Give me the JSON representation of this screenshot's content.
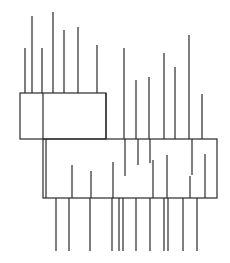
{
  "diagram": {
    "title": "",
    "canvas": {
      "width": 230,
      "height": 263,
      "background": "#ffffff"
    },
    "stroke": {
      "color": "#2b2b2b",
      "spike_color": "#3a3a3a",
      "width": 1.2,
      "spike_width": 1.3
    },
    "rectangles": [
      {
        "name": "upper-box",
        "x": 20,
        "y": 93,
        "w": 86,
        "h": 46
      },
      {
        "name": "lower-box",
        "x": 43,
        "y": 139,
        "w": 174,
        "h": 59
      }
    ],
    "dividers": [
      {
        "name": "upper-box-divider",
        "x1": 43,
        "y1": 93,
        "x2": 43,
        "y2": 139
      },
      {
        "name": "lower-box-left-double",
        "x1": 46,
        "y1": 139,
        "x2": 46,
        "y2": 198
      },
      {
        "name": "upper-box-right-extension",
        "x1": 106,
        "y1": 93,
        "x2": 106,
        "y2": 139
      }
    ],
    "spikes_top_upper": [
      {
        "x": 25,
        "top": 48,
        "base": 93
      },
      {
        "x": 32,
        "top": 16,
        "base": 93
      },
      {
        "x": 42,
        "top": 48,
        "base": 93
      },
      {
        "x": 53,
        "top": 12,
        "base": 93
      },
      {
        "x": 64,
        "top": 30,
        "base": 93
      },
      {
        "x": 78,
        "top": 27,
        "base": 93
      },
      {
        "x": 97,
        "top": 45,
        "base": 93
      }
    ],
    "spikes_top_lower": [
      {
        "x": 124,
        "top": 48,
        "base": 139
      },
      {
        "x": 136,
        "top": 80,
        "base": 139
      },
      {
        "x": 149,
        "top": 77,
        "base": 139
      },
      {
        "x": 164,
        "top": 53,
        "base": 139
      },
      {
        "x": 175,
        "top": 67,
        "base": 139
      },
      {
        "x": 189,
        "top": 35,
        "base": 139
      },
      {
        "x": 202,
        "top": 94,
        "base": 139
      }
    ],
    "inner_drops": [
      {
        "x": 125,
        "y1": 139,
        "y2": 176
      },
      {
        "x": 138,
        "y1": 139,
        "y2": 165
      },
      {
        "x": 150,
        "y1": 139,
        "y2": 163
      },
      {
        "x": 192,
        "y1": 139,
        "y2": 175
      }
    ],
    "inner_rises": [
      {
        "x": 72,
        "y1": 198,
        "y2": 165
      },
      {
        "x": 91,
        "y1": 198,
        "y2": 171
      },
      {
        "x": 113,
        "y1": 198,
        "y2": 162
      },
      {
        "x": 153,
        "y1": 198,
        "y2": 160
      },
      {
        "x": 167,
        "y1": 198,
        "y2": 155
      },
      {
        "x": 190,
        "y1": 198,
        "y2": 176
      },
      {
        "x": 205,
        "y1": 198,
        "y2": 154
      }
    ],
    "spikes_bottom": [
      {
        "x": 56,
        "base": 198,
        "bottom": 251
      },
      {
        "x": 69,
        "base": 198,
        "bottom": 251
      },
      {
        "x": 90,
        "base": 198,
        "bottom": 251
      },
      {
        "x": 112,
        "base": 198,
        "bottom": 251
      },
      {
        "x": 119,
        "base": 198,
        "bottom": 251
      },
      {
        "x": 123,
        "base": 198,
        "bottom": 251
      },
      {
        "x": 136,
        "base": 198,
        "bottom": 251
      },
      {
        "x": 150,
        "base": 198,
        "bottom": 251
      },
      {
        "x": 164,
        "base": 198,
        "bottom": 251
      },
      {
        "x": 168,
        "base": 198,
        "bottom": 251
      },
      {
        "x": 183,
        "base": 198,
        "bottom": 251
      },
      {
        "x": 197,
        "base": 198,
        "bottom": 251
      }
    ]
  }
}
